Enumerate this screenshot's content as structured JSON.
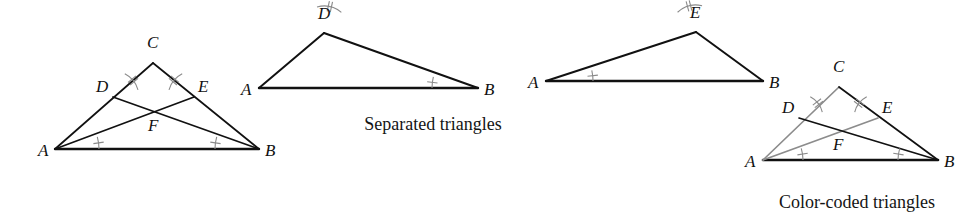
{
  "figure": {
    "background_color": "#ffffff",
    "stroke_black": "#111111",
    "stroke_gray": "#8c8c8c",
    "mark_color": "#8a8a8a",
    "captions": {
      "separated": "Separated triangles",
      "color_coded": "Color-coded triangles"
    }
  },
  "panels": [
    {
      "id": "combined-triangle",
      "name": "combined-triangle",
      "caption": "",
      "vertices": {
        "A": {
          "label": "A",
          "x": 55,
          "y": 149,
          "lx": 38,
          "ly": 156
        },
        "B": {
          "label": "B",
          "x": 259,
          "y": 149,
          "lx": 265,
          "ly": 156
        },
        "C": {
          "label": "C",
          "x": 153,
          "y": 63,
          "lx": 147,
          "ly": 48
        },
        "D": {
          "label": "D",
          "x": 113,
          "y": 97,
          "lx": 96,
          "ly": 92
        },
        "E": {
          "label": "E",
          "x": 194,
          "y": 97,
          "lx": 198,
          "ly": 92
        },
        "F": {
          "label": "F",
          "x": 154,
          "y": 117,
          "lx": 148,
          "ly": 131
        }
      },
      "segments": [
        {
          "name": "side-AB",
          "from": "A",
          "to": "B",
          "color": "#111111",
          "width": 2.4
        },
        {
          "name": "side-AC",
          "from": "A",
          "to": "C",
          "color": "#111111",
          "width": 1.7
        },
        {
          "name": "side-CB",
          "from": "C",
          "to": "B",
          "color": "#111111",
          "width": 1.7
        },
        {
          "name": "cevian-AE",
          "from": "A",
          "to": "E",
          "color": "#111111",
          "width": 1.7
        },
        {
          "name": "cevian-DB",
          "from": "D",
          "to": "B",
          "color": "#111111",
          "width": 1.7
        }
      ],
      "angle_marks": [
        {
          "name": "angle-mark-A",
          "vertex": "A",
          "ticks": 1,
          "r": 44,
          "a1": 0,
          "a2": 16
        },
        {
          "name": "angle-mark-B",
          "vertex": "B",
          "ticks": 1,
          "r": 44,
          "a1": 164,
          "a2": 180
        },
        {
          "name": "angle-mark-D",
          "vertex": "D",
          "ticks": 2,
          "r": 26,
          "a1": 16,
          "a2": 63
        },
        {
          "name": "angle-mark-E",
          "vertex": "E",
          "ticks": 2,
          "r": 26,
          "a1": 117,
          "a2": 164
        }
      ]
    },
    {
      "id": "triangle-ABD",
      "name": "separated-triangle-abd",
      "caption": "",
      "vertices": {
        "A": {
          "label": "A",
          "x": 259,
          "y": 88,
          "lx": 241,
          "ly": 95
        },
        "B": {
          "label": "B",
          "x": 478,
          "y": 88,
          "lx": 484,
          "ly": 95
        },
        "D": {
          "label": "D",
          "x": 324,
          "y": 33,
          "lx": 318,
          "ly": 19
        }
      },
      "segments": [
        {
          "name": "side-AB",
          "from": "A",
          "to": "B",
          "color": "#111111",
          "width": 2.4
        },
        {
          "name": "side-AD",
          "from": "A",
          "to": "D",
          "color": "#111111",
          "width": 2.0
        },
        {
          "name": "side-DB",
          "from": "D",
          "to": "B",
          "color": "#111111",
          "width": 2.0
        }
      ],
      "angle_marks": [
        {
          "name": "angle-mark-D",
          "vertex": "D",
          "ticks": 2,
          "r": 27,
          "a1": 50,
          "a2": 105
        },
        {
          "name": "angle-mark-B",
          "vertex": "B",
          "ticks": 1,
          "r": 46,
          "a1": 166,
          "a2": 180
        }
      ]
    },
    {
      "id": "triangle-ABE",
      "name": "separated-triangle-abe",
      "caption": "",
      "vertices": {
        "A": {
          "label": "A",
          "x": 546,
          "y": 81,
          "lx": 528,
          "ly": 88
        },
        "B": {
          "label": "B",
          "x": 763,
          "y": 81,
          "lx": 769,
          "ly": 88
        },
        "E": {
          "label": "E",
          "x": 696,
          "y": 32,
          "lx": 690,
          "ly": 18
        }
      },
      "segments": [
        {
          "name": "side-AB",
          "from": "A",
          "to": "B",
          "color": "#111111",
          "width": 2.4
        },
        {
          "name": "side-AE",
          "from": "A",
          "to": "E",
          "color": "#111111",
          "width": 2.0
        },
        {
          "name": "side-EB",
          "from": "E",
          "to": "B",
          "color": "#111111",
          "width": 2.0
        }
      ],
      "angle_marks": [
        {
          "name": "angle-mark-A",
          "vertex": "A",
          "ticks": 1,
          "r": 47,
          "a1": 0,
          "a2": 13
        },
        {
          "name": "angle-mark-E",
          "vertex": "E",
          "ticks": 2,
          "r": 27,
          "a1": 77,
          "a2": 133
        }
      ]
    },
    {
      "id": "color-coded-triangle",
      "name": "color-coded-triangle",
      "caption": "Color-coded triangles",
      "vertices": {
        "A": {
          "label": "A",
          "x": 763,
          "y": 160,
          "lx": 745,
          "ly": 167
        },
        "B": {
          "label": "B",
          "x": 938,
          "y": 160,
          "lx": 944,
          "ly": 167
        },
        "C": {
          "label": "C",
          "x": 839,
          "y": 87,
          "lx": 833,
          "ly": 72
        },
        "D": {
          "label": "D",
          "x": 799,
          "y": 118,
          "lx": 782,
          "ly": 113
        },
        "E": {
          "label": "E",
          "x": 878,
          "y": 118,
          "lx": 882,
          "ly": 113
        },
        "F": {
          "label": "F",
          "x": 839,
          "y": 137,
          "lx": 833,
          "ly": 150
        }
      },
      "segments": [
        {
          "name": "side-AB",
          "from": "A",
          "to": "B",
          "color": "#111111",
          "width": 2.6
        },
        {
          "name": "side-AC",
          "from": "A",
          "to": "C",
          "color": "#8c8c8c",
          "width": 1.7
        },
        {
          "name": "side-CB",
          "from": "C",
          "to": "B",
          "color": "#111111",
          "width": 1.7
        },
        {
          "name": "cevian-AE",
          "from": "A",
          "to": "E",
          "color": "#8c8c8c",
          "width": 1.7
        },
        {
          "name": "cevian-DB",
          "from": "D",
          "to": "B",
          "color": "#111111",
          "width": 1.7
        }
      ],
      "angle_marks": [
        {
          "name": "angle-mark-A",
          "vertex": "A",
          "ticks": 1,
          "r": 40,
          "a1": 0,
          "a2": 17
        },
        {
          "name": "angle-mark-B",
          "vertex": "B",
          "ticks": 1,
          "r": 40,
          "a1": 163,
          "a2": 180
        },
        {
          "name": "angle-mark-D",
          "vertex": "D",
          "ticks": 2,
          "r": 24,
          "a1": 14,
          "a2": 62
        },
        {
          "name": "angle-mark-E",
          "vertex": "E",
          "ticks": 2,
          "r": 24,
          "a1": 118,
          "a2": 166
        }
      ]
    }
  ],
  "captions": [
    {
      "name": "caption-separated",
      "text": "Separated triangles",
      "x": 433,
      "y": 130,
      "anchor": "middle"
    },
    {
      "name": "caption-color-coded",
      "text": "Color-coded triangles",
      "x": 857,
      "y": 208,
      "anchor": "middle"
    }
  ]
}
